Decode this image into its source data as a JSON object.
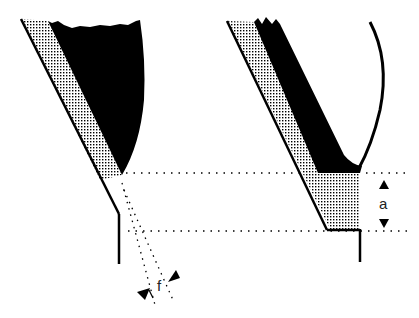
{
  "figure": {
    "labels": {
      "left_dimension": "f",
      "right_dimension": "a"
    },
    "colors": {
      "ink": "#000000",
      "background": "#ffffff",
      "stipple": "#000000"
    },
    "panels": [
      {
        "id": "left",
        "description": "tapered tooth with stippled facet and dotted projection lines, dimension f"
      },
      {
        "id": "right",
        "description": "tooth profile with flat land, stippled region and curved flank, dimension a"
      }
    ]
  }
}
